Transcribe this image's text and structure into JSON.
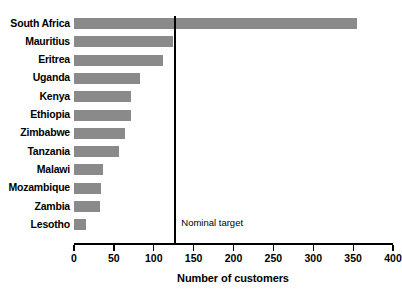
{
  "chart_data": {
    "type": "bar",
    "orientation": "horizontal",
    "title": "",
    "xlabel": "Number of customers",
    "ylabel": "",
    "xlim": [
      0,
      400
    ],
    "xticks": [
      0,
      50,
      100,
      150,
      200,
      250,
      300,
      350,
      400
    ],
    "xtick_labels": [
      "0",
      "50",
      "100",
      "150",
      "200",
      "250",
      "300",
      "350",
      "400"
    ],
    "grid": false,
    "legend": null,
    "bar_color": "#8a8a8a",
    "axis_color": "#000000",
    "categories": [
      "South Africa",
      "Mauritius",
      "Eritrea",
      "Uganda",
      "Kenya",
      "Ethiopia",
      "Zimbabwe",
      "Tanzania",
      "Malawi",
      "Mozambique",
      "Zambia",
      "Lesotho"
    ],
    "values": [
      355,
      124,
      111,
      83,
      71,
      71,
      64,
      56,
      36,
      34,
      32,
      15
    ],
    "annotations": [
      {
        "name": "nominal-target",
        "label": "Nominal target",
        "type": "vline",
        "value": 127
      }
    ]
  }
}
